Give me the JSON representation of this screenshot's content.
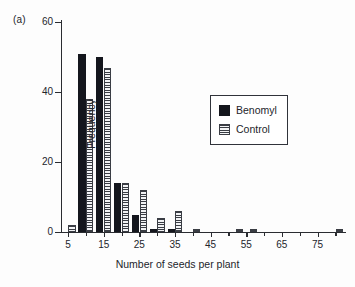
{
  "panel": {
    "label": "(a)"
  },
  "legend": {
    "entries": [
      {
        "name": "Benomyl",
        "pattern": "solid-black",
        "color": "#14161d"
      },
      {
        "name": "Control",
        "pattern": "horizontal-stripes",
        "color": "#3a3d44"
      }
    ]
  },
  "chart_data": {
    "type": "bar",
    "title": "",
    "xlabel": "Number of seeds per plant",
    "ylabel": "Frequency",
    "xlim": [
      3,
      83
    ],
    "ylim": [
      0,
      60
    ],
    "yticks": [
      0,
      20,
      40,
      60
    ],
    "ytick_labels": [
      "0",
      "20",
      "40",
      "60"
    ],
    "xticks": [
      5,
      15,
      25,
      35,
      45,
      55,
      65,
      75
    ],
    "xtick_labels": [
      "5",
      "15",
      "25",
      "35",
      "45",
      "55",
      "65",
      "75"
    ],
    "grid": false,
    "legend_position": "upper right inset",
    "x": [
      5,
      10,
      15,
      20,
      25,
      30,
      35,
      40,
      52,
      56,
      80
    ],
    "series": [
      {
        "name": "Benomyl",
        "values": [
          0,
          51,
          50,
          14,
          5,
          1,
          1,
          0,
          0,
          0,
          0
        ]
      },
      {
        "name": "Control",
        "values": [
          2,
          38,
          47,
          14,
          12,
          4,
          6,
          1,
          1,
          1,
          1
        ]
      }
    ]
  }
}
